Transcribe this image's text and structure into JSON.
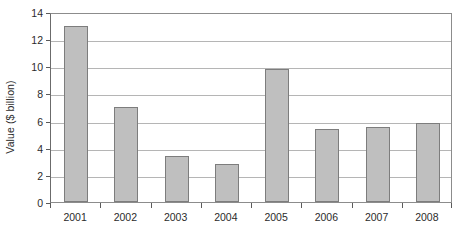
{
  "chart_data": {
    "type": "bar",
    "title": "",
    "subtitle": "",
    "xlabel": "",
    "ylabel": "Value ($ billion)",
    "categories": [
      "2001",
      "2002",
      "2003",
      "2004",
      "2005",
      "2006",
      "2007",
      "2008"
    ],
    "values": [
      13.0,
      7.0,
      3.4,
      2.8,
      9.8,
      5.4,
      5.5,
      5.85
    ],
    "series": [
      {
        "name": "Value",
        "values": [
          13.0,
          7.0,
          3.4,
          2.8,
          9.8,
          5.4,
          5.5,
          5.85
        ]
      }
    ],
    "ylim": [
      0,
      14
    ],
    "ytick_step": 2,
    "yticks": [
      0,
      2,
      4,
      6,
      8,
      10,
      12,
      14
    ],
    "ytick_labels": [
      "0",
      "2",
      "4",
      "6",
      "8",
      "10",
      "12",
      "14"
    ],
    "xtick_labels": [
      "2001",
      "2002",
      "2003",
      "2004",
      "2005",
      "2006",
      "2007",
      "2008"
    ],
    "grid": true,
    "grid_axis": "y",
    "legend": false,
    "legend_position": "none",
    "bar_fill_color": "#bfbfbf",
    "bar_border_color": "#7d7d7d",
    "gridline_color": "#b5b5b5",
    "axis_color": "#6b6b6b",
    "plot_background": "#ffffff",
    "text_color": "#2b2b2b",
    "annotations": []
  }
}
